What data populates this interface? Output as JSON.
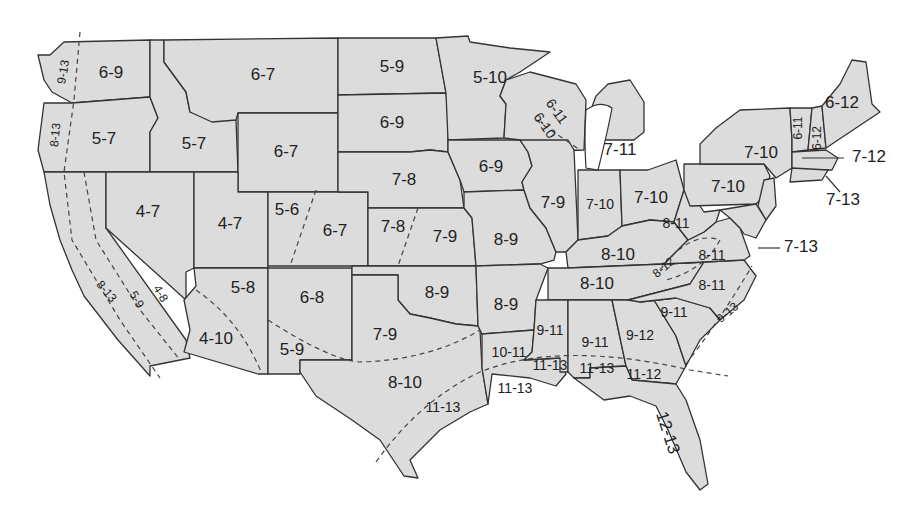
{
  "map": {
    "subject": "United States plant hardiness zone ranges by state",
    "colors": {
      "land": "#dcdcdc",
      "border": "#333333",
      "background": "#ffffff",
      "text": "#222222"
    },
    "labels": {
      "wa": "6-9",
      "wa_coast": "9-13",
      "or": "5-7",
      "or_coast": "8-13",
      "ca_coast": "8-13",
      "ca_mid": "5-9",
      "ca_inland": "4-8",
      "id": "5-7",
      "mt": "6-7",
      "wy": "6-7",
      "nv": "4-7",
      "ut": "4-7",
      "co_west": "5-6",
      "co_east": "6-7",
      "az_north": "5-8",
      "az_south": "4-10",
      "nm": "6-8",
      "nm_south": "5-9",
      "nd": "5-9",
      "sd": "6-9",
      "ne": "7-8",
      "ks_west": "7-8",
      "ks_east": "7-9",
      "ok": "8-9",
      "tx_north": "7-9",
      "tx_central": "8-10",
      "tx_coast": "11-13",
      "mn": "5-10",
      "wi_west": "6-10",
      "wi_east": "6-11",
      "ia": "6-9",
      "mo": "8-9",
      "ar": "8-9",
      "la_north": "10-11",
      "la_south": "11-13",
      "il": "7-9",
      "in": "7-10",
      "mi": "7-11",
      "oh": "7-10",
      "ky": "8-10",
      "tn": "8-10",
      "ms": "9-11",
      "ms_south": "11-13",
      "al": "9-11",
      "al_south": "11-13",
      "ga": "9-12",
      "ga_south": "11-12",
      "fl": "12-13",
      "sc": "9-11",
      "nc": "8-11",
      "nc_coast": "9-13",
      "va": "8-11",
      "wv": "8-11",
      "appalachia": "8-12",
      "pa": "7-10",
      "ny": "7-10",
      "vt": "6-11",
      "nh": "6-12",
      "me": "6-12",
      "ma_callout": "7-12",
      "ri_callout": "7-13",
      "md_callout": "7-13"
    }
  }
}
